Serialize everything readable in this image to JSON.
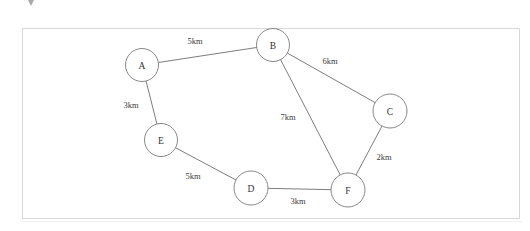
{
  "panel": {
    "background_color": "#ffffff",
    "border_color": "#d8d8d8"
  },
  "artifact": {
    "name": "caret-artifact",
    "color": "#555555"
  },
  "chart_data": {
    "type": "diagram",
    "subtype": "weighted-undirected-graph",
    "title": "",
    "xlabel": "",
    "ylabel": "",
    "grid": false,
    "legend": "none",
    "units": "km",
    "node_radius": 16.5,
    "node_fill": "#ffffff",
    "node_stroke": "#7a7a7a",
    "edge_stroke": "#6e6e6e",
    "nodes": [
      {
        "id": "A",
        "label": "A",
        "x": 142,
        "y": 65,
        "r": 16.5
      },
      {
        "id": "B",
        "label": "B",
        "x": 273,
        "y": 45,
        "r": 16.5
      },
      {
        "id": "C",
        "label": "C",
        "x": 390,
        "y": 111,
        "r": 17
      },
      {
        "id": "D",
        "label": "D",
        "x": 251,
        "y": 188,
        "r": 17
      },
      {
        "id": "E",
        "label": "E",
        "x": 161,
        "y": 140,
        "r": 16.5
      },
      {
        "id": "F",
        "label": "F",
        "x": 348,
        "y": 190,
        "r": 17
      }
    ],
    "edges": [
      {
        "from": "A",
        "to": "B",
        "weight": 5,
        "label": "5km",
        "label_x": 195,
        "label_y": 41
      },
      {
        "from": "B",
        "to": "C",
        "weight": 6,
        "label": "6km",
        "label_x": 330,
        "label_y": 61
      },
      {
        "from": "A",
        "to": "E",
        "weight": 3,
        "label": "3km",
        "label_x": 131,
        "label_y": 105
      },
      {
        "from": "B",
        "to": "F",
        "weight": 7,
        "label": "7km",
        "label_x": 288,
        "label_y": 117
      },
      {
        "from": "C",
        "to": "F",
        "weight": 2,
        "label": "2km",
        "label_x": 384,
        "label_y": 157
      },
      {
        "from": "E",
        "to": "D",
        "weight": 5,
        "label": "5km",
        "label_x": 193,
        "label_y": 176
      },
      {
        "from": "D",
        "to": "F",
        "weight": 3,
        "label": "3km",
        "label_x": 298,
        "label_y": 201
      }
    ]
  }
}
